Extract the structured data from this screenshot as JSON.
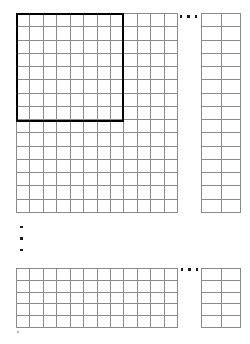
{
  "figure": {
    "type": "schematic-grid",
    "background_color": "#ffffff",
    "grid_line_color": "#8a8a8a",
    "highlight_color": "#000000",
    "dot_color": "#1a1a1a"
  },
  "blocks": [
    {
      "id": "main-grid",
      "name": "main-grid",
      "label": "",
      "x": 16,
      "y": 13,
      "width": 162,
      "height": 200,
      "columns": 12,
      "rows": 15,
      "cell_width": 13.5,
      "cell_height": 13.33
    },
    {
      "id": "right-grid",
      "name": "right-column-grid",
      "label": "",
      "x": 201,
      "y": 13,
      "width": 40,
      "height": 200,
      "columns": 2,
      "rows": 15,
      "cell_width": 20,
      "cell_height": 13.33
    },
    {
      "id": "bottom-grid",
      "name": "bottom-row-grid",
      "label": "",
      "x": 16,
      "y": 268,
      "width": 162,
      "height": 60,
      "columns": 12,
      "rows": 5,
      "cell_width": 13.5,
      "cell_height": 12
    },
    {
      "id": "bottom-right-grid",
      "name": "bottom-right-corner-grid",
      "label": "",
      "x": 201,
      "y": 268,
      "width": 40,
      "height": 60,
      "columns": 2,
      "rows": 5,
      "cell_width": 20,
      "cell_height": 12
    }
  ],
  "selection": {
    "name": "highlighted-tile-region",
    "label": "",
    "x": 16,
    "y": 13,
    "width": 108,
    "height": 109,
    "columns": 8,
    "rows": 8,
    "stroke_width": 2,
    "stroke_color": "#000000"
  },
  "ellipses": [
    {
      "id": "top-horizontal-ellipsis",
      "name": "horizontal-ellipsis-top",
      "orientation": "horizontal",
      "dots": 3,
      "x": 180,
      "y": 15,
      "length": 17,
      "thickness": 3
    },
    {
      "id": "left-vertical-ellipsis",
      "name": "vertical-ellipsis-left",
      "orientation": "vertical",
      "dots": 3,
      "x": 20,
      "y": 226,
      "length": 25,
      "thickness": 3
    },
    {
      "id": "bottom-horizontal-ellipsis",
      "name": "horizontal-ellipsis-bottom",
      "orientation": "horizontal",
      "dots": 3,
      "x": 181,
      "y": 268,
      "length": 17,
      "thickness": 3
    }
  ],
  "specks": [
    {
      "name": "artifact-speck",
      "x": 17,
      "y": 331
    }
  ]
}
